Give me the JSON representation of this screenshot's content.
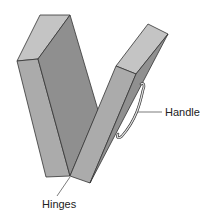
{
  "labels": {
    "handle": "Handle",
    "hinges": "Hinges"
  },
  "colors": {
    "light_face": "#c2c2c2",
    "mid_face": "#a8a8a8",
    "dark_face": "#8e8e8e",
    "outline": "#333333",
    "handle": "#d9d9d9"
  }
}
